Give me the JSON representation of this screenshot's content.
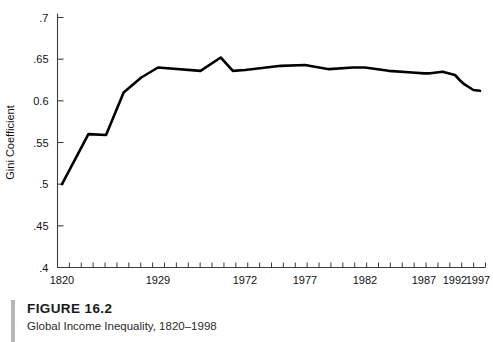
{
  "figure": {
    "number_label": "FIGURE 16.2",
    "caption": "Global Income Inequality, 1820–1998"
  },
  "chart_data": {
    "type": "line",
    "title": "",
    "xlabel": "",
    "ylabel": "Gini Coefficient",
    "xlim": [
      1820,
      1998
    ],
    "ylim": [
      0.4,
      0.7
    ],
    "grid": false,
    "legend": "none",
    "y_ticks": [
      0.4,
      0.45,
      0.5,
      0.55,
      0.6,
      0.65,
      0.7
    ],
    "y_tick_labels": [
      ".4",
      ".45",
      ".5",
      ".55",
      "0.6",
      ".65",
      ".7"
    ],
    "x_tick_labels": [
      "1820",
      "1929",
      "1972",
      "1977",
      "1982",
      "1987",
      "1992",
      "1997"
    ],
    "x_tick_label_values": [
      1820,
      1929,
      1972,
      1977,
      1982,
      1987,
      1992,
      1997
    ],
    "x_minor_tick_count": 36,
    "line_color": "#000000",
    "line_width": 2.6,
    "axis_color": "#3c3c3c",
    "series": [
      {
        "name": "Gini Coefficient",
        "x": [
          1820,
          1850,
          1870,
          1890,
          1910,
          1929,
          1950,
          1960,
          1966,
          1972,
          1975,
          1977,
          1979,
          1981,
          1982,
          1984,
          1986,
          1987,
          1988,
          1990,
          1992,
          1993,
          1994,
          1996,
          1998
        ],
        "values": [
          0.5,
          0.56,
          0.559,
          0.61,
          0.628,
          0.64,
          0.636,
          0.652,
          0.636,
          0.637,
          0.642,
          0.643,
          0.638,
          0.64,
          0.64,
          0.636,
          0.634,
          0.633,
          0.633,
          0.635,
          0.631,
          0.625,
          0.62,
          0.613,
          0.612
        ]
      }
    ]
  }
}
